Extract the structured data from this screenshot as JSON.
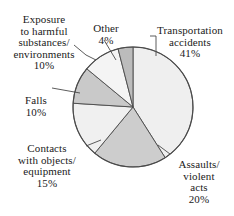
{
  "chart_data": {
    "type": "pie",
    "title": "",
    "subtitle": "",
    "xlabel": "",
    "ylabel": "",
    "legend_position": "none",
    "labels_position": "outside-with-leader-lines",
    "grid": false,
    "units": "percent",
    "total": 100,
    "categories": [
      "Transportation accidents",
      "Assaults/ violent acts",
      "Contacts with objects/ equipment",
      "Falls",
      "Exposure to harmful substances/ environments",
      "Other"
    ],
    "values": [
      41,
      20,
      15,
      10,
      10,
      4
    ],
    "slices": [
      {
        "name": "Transportation accidents",
        "label_lines": [
          "Transportation",
          "accidents"
        ],
        "value": 41,
        "value_text": "41%",
        "color": "#efefef",
        "start_angle_deg": 0,
        "end_angle_deg": 147.6
      },
      {
        "name": "Assaults/ violent acts",
        "label_lines": [
          "Assaults/",
          "violent",
          "acts"
        ],
        "value": 20,
        "value_text": "20%",
        "color": "#cdcdcd",
        "start_angle_deg": 147.6,
        "end_angle_deg": 219.6
      },
      {
        "name": "Contacts with objects/ equipment",
        "label_lines": [
          "Contacts",
          "with objects/",
          "equipment"
        ],
        "value": 15,
        "value_text": "15%",
        "color": "#f0f0f0",
        "start_angle_deg": 219.6,
        "end_angle_deg": 273.6
      },
      {
        "name": "Falls",
        "label_lines": [
          "Falls"
        ],
        "value": 10,
        "value_text": "10%",
        "color": "#c9c9c9",
        "start_angle_deg": 273.6,
        "end_angle_deg": 309.6
      },
      {
        "name": "Exposure to harmful substances/ environments",
        "label_lines": [
          "Exposure",
          "to harmful",
          "substances/",
          "environments"
        ],
        "value": 10,
        "value_text": "10%",
        "color": "#f4f4f4",
        "start_angle_deg": 309.6,
        "end_angle_deg": 345.6
      },
      {
        "name": "Other",
        "label_lines": [
          "Other"
        ],
        "value": 4,
        "value_text": "4%",
        "color": "#bcbcbc",
        "start_angle_deg": 345.6,
        "end_angle_deg": 360
      }
    ],
    "geometry": {
      "center_x": 133,
      "center_y": 107,
      "radius": 60,
      "outline_color": "#4a4a4a",
      "background": "#ffffff"
    }
  },
  "labels": {
    "transport": {
      "text": "Transportation\naccidents",
      "pct": "41%"
    },
    "assaults": {
      "text": "Assaults/\nviolent\nacts",
      "pct": "20%"
    },
    "contacts": {
      "text": "Contacts\nwith objects/\nequipment",
      "pct": "15%"
    },
    "falls": {
      "text": "Falls",
      "pct": "10%"
    },
    "exposure": {
      "text": "Exposure\nto harmful\nsubstances/\nenvironments",
      "pct": "10%"
    },
    "other": {
      "text": "Other",
      "pct": "4%"
    }
  }
}
